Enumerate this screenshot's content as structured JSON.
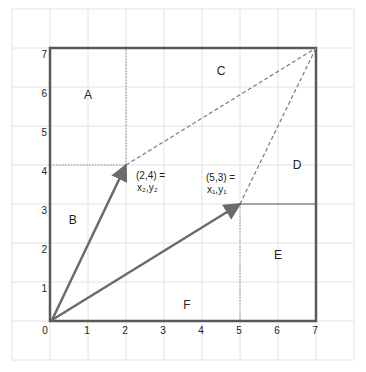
{
  "diagram": {
    "title": "",
    "colors": {
      "grid": "#e2e2e2",
      "square": "#595959",
      "vector": "#6b6b6b",
      "dashed": "#7a7a7a",
      "dotted": "#8a8a8a",
      "text": "#222222"
    },
    "axes": {
      "x_ticks": [
        "0",
        "1",
        "2",
        "3",
        "4",
        "5",
        "6",
        "7"
      ],
      "y_ticks": [
        "0",
        "1",
        "2",
        "3",
        "4",
        "5",
        "6",
        "7"
      ],
      "x_range": [
        0,
        7
      ],
      "y_range": [
        0,
        7
      ]
    },
    "regions": [
      {
        "label": "A",
        "x": 1.0,
        "y": 5.8
      },
      {
        "label": "B",
        "x": 0.6,
        "y": 2.6
      },
      {
        "label": "C",
        "x": 4.5,
        "y": 6.4
      },
      {
        "label": "D",
        "x": 6.5,
        "y": 4.0
      },
      {
        "label": "E",
        "x": 6.0,
        "y": 1.7
      },
      {
        "label": "F",
        "x": 3.6,
        "y": 0.4
      }
    ],
    "points": [
      {
        "coord": "(2,4) =",
        "sub": "x₂,y₂",
        "x": 2,
        "y": 4
      },
      {
        "coord": "(5,3) =",
        "sub": "x₁,y₁",
        "x": 5,
        "y": 3
      }
    ],
    "vectors": [
      {
        "from": [
          0,
          0
        ],
        "to": [
          2,
          4
        ],
        "style": "solid-arrow"
      },
      {
        "from": [
          0,
          0
        ],
        "to": [
          5,
          3
        ],
        "style": "solid-arrow"
      },
      {
        "from": [
          2,
          4
        ],
        "to": [
          7,
          7
        ],
        "style": "dashed"
      },
      {
        "from": [
          5,
          3
        ],
        "to": [
          7,
          7
        ],
        "style": "dashed"
      }
    ],
    "square": {
      "from": [
        0,
        0
      ],
      "to": [
        7,
        7
      ]
    }
  }
}
